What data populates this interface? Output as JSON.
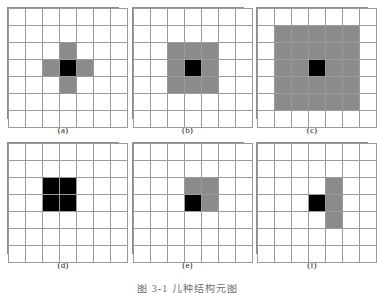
{
  "figure": {
    "background_color": "#ffffff",
    "grid_line_color": "#9a9a9a",
    "gray_fill_color": "#8b8b8b",
    "black_fill_color": "#000000",
    "grid_rows": 7,
    "grid_cols": 7,
    "bottom_caption": "图 3-1  几种结构元图"
  },
  "panels": [
    {
      "caption": "(a)",
      "name": "panel-a",
      "cells": [
        [
          "w",
          "w",
          "w",
          "w",
          "w",
          "w",
          "w"
        ],
        [
          "w",
          "w",
          "w",
          "w",
          "w",
          "w",
          "w"
        ],
        [
          "w",
          "w",
          "w",
          "g",
          "w",
          "w",
          "w"
        ],
        [
          "w",
          "w",
          "g",
          "b",
          "g",
          "w",
          "w"
        ],
        [
          "w",
          "w",
          "w",
          "g",
          "w",
          "w",
          "w"
        ],
        [
          "w",
          "w",
          "w",
          "w",
          "w",
          "w",
          "w"
        ],
        [
          "w",
          "w",
          "w",
          "w",
          "w",
          "w",
          "w"
        ]
      ]
    },
    {
      "caption": "(b)",
      "name": "panel-b",
      "cells": [
        [
          "w",
          "w",
          "w",
          "w",
          "w",
          "w",
          "w"
        ],
        [
          "w",
          "w",
          "w",
          "w",
          "w",
          "w",
          "w"
        ],
        [
          "w",
          "w",
          "g",
          "g",
          "g",
          "w",
          "w"
        ],
        [
          "w",
          "w",
          "g",
          "b",
          "g",
          "w",
          "w"
        ],
        [
          "w",
          "w",
          "g",
          "g",
          "g",
          "w",
          "w"
        ],
        [
          "w",
          "w",
          "w",
          "w",
          "w",
          "w",
          "w"
        ],
        [
          "w",
          "w",
          "w",
          "w",
          "w",
          "w",
          "w"
        ]
      ]
    },
    {
      "caption": "(c)",
      "name": "panel-c",
      "cells": [
        [
          "w",
          "w",
          "w",
          "w",
          "w",
          "w",
          "w"
        ],
        [
          "w",
          "g",
          "g",
          "g",
          "g",
          "g",
          "w"
        ],
        [
          "w",
          "g",
          "g",
          "g",
          "g",
          "g",
          "w"
        ],
        [
          "w",
          "g",
          "g",
          "b",
          "g",
          "g",
          "w"
        ],
        [
          "w",
          "g",
          "g",
          "g",
          "g",
          "g",
          "w"
        ],
        [
          "w",
          "g",
          "g",
          "g",
          "g",
          "g",
          "w"
        ],
        [
          "w",
          "w",
          "w",
          "w",
          "w",
          "w",
          "w"
        ]
      ]
    },
    {
      "caption": "(d)",
      "name": "panel-d",
      "cells": [
        [
          "w",
          "w",
          "w",
          "w",
          "w",
          "w",
          "w"
        ],
        [
          "w",
          "w",
          "w",
          "w",
          "w",
          "w",
          "w"
        ],
        [
          "w",
          "w",
          "b",
          "b",
          "w",
          "w",
          "w"
        ],
        [
          "w",
          "w",
          "b",
          "b",
          "w",
          "w",
          "w"
        ],
        [
          "w",
          "w",
          "w",
          "w",
          "w",
          "w",
          "w"
        ],
        [
          "w",
          "w",
          "w",
          "w",
          "w",
          "w",
          "w"
        ],
        [
          "w",
          "w",
          "w",
          "w",
          "w",
          "w",
          "w"
        ]
      ]
    },
    {
      "caption": "(e)",
      "name": "panel-e",
      "cells": [
        [
          "w",
          "w",
          "w",
          "w",
          "w",
          "w",
          "w"
        ],
        [
          "w",
          "w",
          "w",
          "w",
          "w",
          "w",
          "w"
        ],
        [
          "w",
          "w",
          "w",
          "g",
          "g",
          "w",
          "w"
        ],
        [
          "w",
          "w",
          "w",
          "b",
          "g",
          "w",
          "w"
        ],
        [
          "w",
          "w",
          "w",
          "w",
          "w",
          "w",
          "w"
        ],
        [
          "w",
          "w",
          "w",
          "w",
          "w",
          "w",
          "w"
        ],
        [
          "w",
          "w",
          "w",
          "w",
          "w",
          "w",
          "w"
        ]
      ]
    },
    {
      "caption": "(f)",
      "name": "panel-f",
      "cells": [
        [
          "w",
          "w",
          "w",
          "w",
          "w",
          "w",
          "w"
        ],
        [
          "w",
          "w",
          "w",
          "w",
          "w",
          "w",
          "w"
        ],
        [
          "w",
          "w",
          "w",
          "w",
          "g",
          "w",
          "w"
        ],
        [
          "w",
          "w",
          "w",
          "b",
          "g",
          "w",
          "w"
        ],
        [
          "w",
          "w",
          "w",
          "w",
          "g",
          "w",
          "w"
        ],
        [
          "w",
          "w",
          "w",
          "w",
          "w",
          "w",
          "w"
        ],
        [
          "w",
          "w",
          "w",
          "w",
          "w",
          "w",
          "w"
        ]
      ]
    }
  ]
}
